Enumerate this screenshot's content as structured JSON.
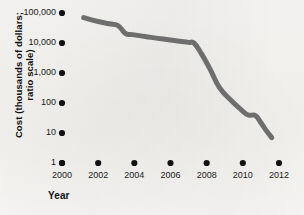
{
  "chart_data": {
    "type": "line",
    "title": "",
    "xlabel": "Year",
    "ylabel": "Cost (thousands of dollars; ratio scale)",
    "ylabel_line1": "Cost (thousands of dollars;",
    "ylabel_line2": "ratio scale)",
    "yscale": "log",
    "ylim": [
      1,
      100000
    ],
    "xlim": [
      2000,
      2012
    ],
    "grid": false,
    "legend": false,
    "y_ticks": [
      {
        "value": 100000,
        "label": "100,000"
      },
      {
        "value": 10000,
        "label": "10,000"
      },
      {
        "value": 1000,
        "label": "1,000"
      },
      {
        "value": 100,
        "label": "100"
      },
      {
        "value": 10,
        "label": "10"
      },
      {
        "value": 1,
        "label": "1"
      }
    ],
    "x_ticks": [
      {
        "value": 2000,
        "label": "2000"
      },
      {
        "value": 2002,
        "label": "2002"
      },
      {
        "value": 2004,
        "label": "2004"
      },
      {
        "value": 2006,
        "label": "2006"
      },
      {
        "value": 2008,
        "label": "2008"
      },
      {
        "value": 2010,
        "label": "2010"
      },
      {
        "value": 2012,
        "label": "2012"
      }
    ],
    "series": [
      {
        "name": "Cost",
        "color": "#6e6e6e",
        "x": [
          2001.2,
          2002.0,
          2002.6,
          2003.1,
          2003.5,
          2003.9,
          2004.6,
          2005.6,
          2006.5,
          2007.0,
          2007.3,
          2007.7,
          2008.2,
          2008.7,
          2009.3,
          2009.9,
          2010.3,
          2010.7,
          2011.0,
          2011.3,
          2011.6
        ],
        "values": [
          70000,
          52000,
          44000,
          38000,
          21000,
          19000,
          16500,
          13500,
          11500,
          10500,
          10000,
          4500,
          1300,
          330,
          130,
          60,
          40,
          38,
          22,
          12,
          7
        ]
      }
    ],
    "line_color": "#6e6e6e",
    "line_width_px": 5,
    "marker_color": "#111111",
    "background_color": "#f6f5f2"
  }
}
